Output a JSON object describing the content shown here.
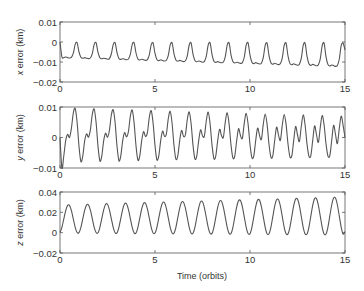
{
  "chart_data": [
    {
      "type": "line",
      "xlabel": "",
      "ylabel": "x error (km)",
      "ylabel_var": "x",
      "ylabel_rest": " error (km)",
      "xlim": [
        0,
        15
      ],
      "ylim": [
        -0.02,
        0.01
      ],
      "xticks": [
        0,
        5,
        10,
        15
      ],
      "xtick_labels": [
        "0",
        "5",
        "10",
        "15"
      ],
      "yticks": [
        -0.02,
        -0.01,
        0,
        0.01
      ],
      "ytick_labels": [
        "−0.02",
        "−0.01",
        "0",
        "0.01"
      ],
      "grid": false,
      "x_step": 0.1,
      "series": [
        {
          "name": "x error",
          "color": "#555555",
          "values": [
            0.0,
            -0.0074,
            -0.0078,
            -0.0075,
            -0.0078,
            -0.008,
            -0.0077,
            -0.0056,
            -0.0012,
            -0.0004,
            -0.005,
            -0.0076,
            -0.0081,
            -0.0078,
            -0.0081,
            -0.0083,
            -0.008,
            -0.0058,
            -0.0012,
            -0.0004,
            -0.0052,
            -0.0079,
            -0.0084,
            -0.0081,
            -0.0083,
            -0.0086,
            -0.0083,
            -0.006,
            -0.0013,
            -0.0004,
            -0.0053,
            -0.0082,
            -0.0087,
            -0.0084,
            -0.0086,
            -0.0089,
            -0.0085,
            -0.0062,
            -0.0013,
            -0.0004,
            -0.0055,
            -0.0085,
            -0.009,
            -0.0086,
            -0.0089,
            -0.0092,
            -0.0088,
            -0.0064,
            -0.0014,
            -0.0005,
            -0.0057,
            -0.0087,
            -0.0093,
            -0.0089,
            -0.0092,
            -0.0095,
            -0.0091,
            -0.0067,
            -0.0014,
            -0.0005,
            -0.0059,
            -0.009,
            -0.0096,
            -0.0092,
            -0.0095,
            -0.0098,
            -0.0094,
            -0.0069,
            -0.0015,
            -0.0005,
            -0.0061,
            -0.0093,
            -0.0099,
            -0.0095,
            -0.0098,
            -0.0101,
            -0.0097,
            -0.0071,
            -0.0015,
            -0.0005,
            -0.0062,
            -0.0096,
            -0.0102,
            -0.0098,
            -0.0101,
            -0.0104,
            -0.01,
            -0.0073,
            -0.0016,
            -0.0005,
            -0.0064,
            -0.0098,
            -0.0105,
            -0.0101,
            -0.0104,
            -0.0107,
            -0.0103,
            -0.0075,
            -0.0016,
            -0.0005,
            -0.0066,
            -0.0101,
            -0.0108,
            -0.0103,
            -0.0107,
            -0.011,
            -0.0106,
            -0.0077,
            -0.0017,
            -0.0006,
            -0.0068,
            -0.0104,
            -0.0111,
            -0.0106,
            -0.011,
            -0.0113,
            -0.0108,
            -0.0079,
            -0.0017,
            -0.0006,
            -0.007,
            -0.0107,
            -0.0114,
            -0.0109,
            -0.0113,
            -0.0116,
            -0.0111,
            -0.0081,
            -0.0017,
            -0.0006,
            -0.0071,
            -0.0109,
            -0.0117,
            -0.0112,
            -0.0115,
            -0.0119,
            -0.0114,
            -0.0083,
            -0.0018,
            -0.0006,
            -0.0073,
            -0.0112,
            -0.012,
            -0.0115,
            -0.0118,
            -0.0122,
            -0.0117,
            -0.0085,
            -0.0018,
            -0.0006,
            -0.004
          ]
        }
      ]
    },
    {
      "type": "line",
      "xlabel": "",
      "ylabel": "y error (km)",
      "ylabel_var": "y",
      "ylabel_rest": " error (km)",
      "xlim": [
        0,
        15
      ],
      "ylim": [
        -0.01,
        0.01
      ],
      "xticks": [
        0,
        5,
        10,
        15
      ],
      "xtick_labels": [
        "0",
        "5",
        "10",
        "15"
      ],
      "yticks": [
        -0.01,
        0,
        0.01
      ],
      "ytick_labels": [
        "−0.01",
        "0",
        "0.01"
      ],
      "grid": false,
      "x_step": 0.1,
      "series": [
        {
          "name": "y error",
          "color": "#555555",
          "values": [
            0.0,
            -0.01,
            -0.006,
            -0.001,
            0.001,
            0.0,
            0.003,
            0.008,
            0.0095,
            0.005,
            -0.0029,
            -0.0079,
            -0.006,
            -0.001,
            0.0012,
            0.0001,
            0.0026,
            0.0076,
            0.0093,
            0.0049,
            -0.0029,
            -0.0077,
            -0.006,
            -0.001,
            0.0014,
            0.0001,
            0.0023,
            0.0073,
            0.0091,
            0.0049,
            -0.0028,
            -0.0076,
            -0.006,
            -0.001,
            0.0016,
            0.0002,
            0.0019,
            0.0069,
            0.009,
            0.0048,
            -0.0027,
            -0.0074,
            -0.006,
            -0.001,
            0.0019,
            0.0003,
            0.0016,
            0.0066,
            0.0088,
            0.0047,
            -0.0026,
            -0.0073,
            -0.006,
            -0.001,
            0.0021,
            0.0004,
            0.0012,
            0.0062,
            0.0086,
            0.0046,
            -0.0026,
            -0.0071,
            -0.006,
            -0.001,
            0.0023,
            0.0004,
            0.0009,
            0.0059,
            0.0084,
            0.0046,
            -0.0025,
            -0.007,
            -0.006,
            -0.001,
            0.0025,
            0.0005,
            0.0005,
            0.0055,
            0.0083,
            0.0045,
            -0.0024,
            -0.0069,
            -0.006,
            -0.001,
            0.0027,
            0.0006,
            0.0001,
            0.0051,
            0.0081,
            0.0044,
            -0.0024,
            -0.0067,
            -0.006,
            -0.001,
            0.0029,
            0.0006,
            -0.0002,
            0.0048,
            0.0079,
            0.0044,
            -0.0023,
            -0.0066,
            -0.006,
            -0.001,
            0.0031,
            0.0007,
            -0.0006,
            0.0044,
            0.0077,
            0.0043,
            -0.0022,
            -0.0064,
            -0.006,
            -0.001,
            0.0034,
            0.0008,
            -0.0009,
            0.0041,
            0.0075,
            0.0042,
            -0.0021,
            -0.0063,
            -0.006,
            -0.001,
            0.0036,
            0.0009,
            -0.0013,
            0.0037,
            0.0074,
            0.0041,
            -0.0021,
            -0.0061,
            -0.006,
            -0.001,
            0.0038,
            0.0009,
            -0.0016,
            0.0034,
            0.0072,
            0.0041,
            -0.002,
            -0.006,
            -0.006,
            -0.001,
            0.004,
            0.001,
            -0.002,
            0.003,
            0.007,
            0.004,
            0.0
          ]
        }
      ]
    },
    {
      "type": "line",
      "xlabel": "Time (orbits)",
      "ylabel": "z error (km)",
      "ylabel_var": "z",
      "ylabel_rest": " error (km)",
      "xlim": [
        0,
        15
      ],
      "ylim": [
        -0.02,
        0.04
      ],
      "xticks": [
        0,
        5,
        10,
        15
      ],
      "xtick_labels": [
        "0",
        "5",
        "10",
        "15"
      ],
      "yticks": [
        -0.02,
        0,
        0.02,
        0.04
      ],
      "ytick_labels": [
        "−0.02",
        "0",
        "0.02",
        "0.04"
      ],
      "grid": false,
      "x_step": 0.1,
      "series": [
        {
          "name": "z error",
          "color": "#555555",
          "values": [
            0.0002,
            0.0053,
            0.0135,
            0.0217,
            0.0268,
            0.0268,
            0.0217,
            0.0135,
            0.0053,
            0.0002,
            0.0001,
            0.0053,
            0.0137,
            0.0221,
            0.0273,
            0.0273,
            0.0221,
            0.0137,
            0.0053,
            0.0001,
            -0.0001,
            0.0053,
            0.0139,
            0.0225,
            0.0279,
            0.0279,
            0.0225,
            0.0139,
            0.0053,
            -0.0001,
            -0.0002,
            0.0053,
            0.0141,
            0.0229,
            0.0284,
            0.0284,
            0.0229,
            0.0141,
            0.0053,
            -0.0002,
            -0.0003,
            0.0053,
            0.0143,
            0.0233,
            0.0289,
            0.0289,
            0.0233,
            0.0143,
            0.0053,
            -0.0003,
            -0.0004,
            0.0053,
            0.0145,
            0.0237,
            0.0294,
            0.0294,
            0.0237,
            0.0145,
            0.0053,
            -0.0004,
            -0.0005,
            0.0053,
            0.0147,
            0.0241,
            0.0299,
            0.0299,
            0.0241,
            0.0147,
            0.0053,
            -0.0005,
            -0.0006,
            0.0053,
            0.0149,
            0.0245,
            0.0304,
            0.0304,
            0.0245,
            0.0149,
            0.0053,
            -0.0006,
            -0.0007,
            0.0053,
            0.0151,
            0.0249,
            0.0309,
            0.0309,
            0.0249,
            0.0151,
            0.0053,
            -0.0007,
            -0.0009,
            0.0053,
            0.0153,
            0.0253,
            0.0315,
            0.0315,
            0.0253,
            0.0153,
            0.0053,
            -0.0009,
            -0.001,
            0.0053,
            0.0155,
            0.0257,
            0.032,
            0.032,
            0.0257,
            0.0155,
            0.0053,
            -0.001,
            -0.001,
            0.0053,
            0.0157,
            0.0261,
            0.0324,
            0.0324,
            0.0261,
            0.0157,
            0.0053,
            -0.001,
            -0.0012,
            0.0053,
            0.0159,
            0.0265,
            0.033,
            0.033,
            0.0265,
            0.0159,
            0.0053,
            -0.0012,
            -0.0013,
            0.0053,
            0.0161,
            0.0269,
            0.0335,
            0.0335,
            0.0269,
            0.0161,
            0.0053,
            -0.0013,
            -0.0014,
            0.0053,
            0.0163,
            0.0272,
            0.034,
            0.034,
            0.0272,
            0.0163,
            0.0053,
            -0.0014,
            0.001
          ]
        }
      ]
    }
  ]
}
